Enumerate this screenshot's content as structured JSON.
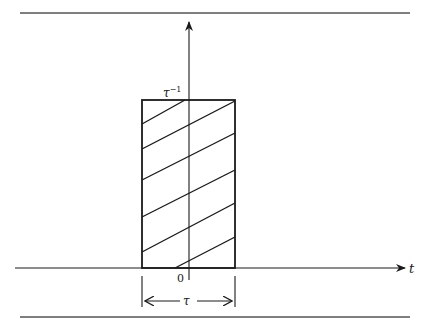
{
  "diagram": {
    "title": "",
    "colors": {
      "background": "#ffffff",
      "ink": "#1a1a1a",
      "rule": "#555555"
    },
    "labels": {
      "amplitude": "τ",
      "amplitude_exp": "−1",
      "horizontal_axis": "t",
      "origin": "0",
      "width": "τ"
    },
    "pulse": {
      "height_label": "τ⁻¹",
      "width_label": "τ",
      "hatch_line_count": 6
    }
  }
}
